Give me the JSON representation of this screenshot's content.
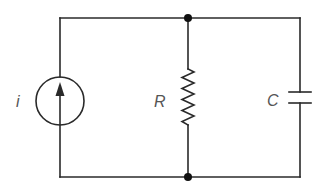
{
  "diagram": {
    "type": "circuit",
    "components": [
      {
        "id": "source",
        "kind": "current-source",
        "label": "i",
        "direction": "up"
      },
      {
        "id": "resistor",
        "kind": "resistor",
        "label": "R"
      },
      {
        "id": "capacitor",
        "kind": "capacitor",
        "label": "C"
      }
    ],
    "nodes": [
      "top-junction",
      "bottom-junction"
    ],
    "colors": {
      "wire": "#2a2a2a",
      "label": "#555555",
      "node": "#111111"
    }
  }
}
